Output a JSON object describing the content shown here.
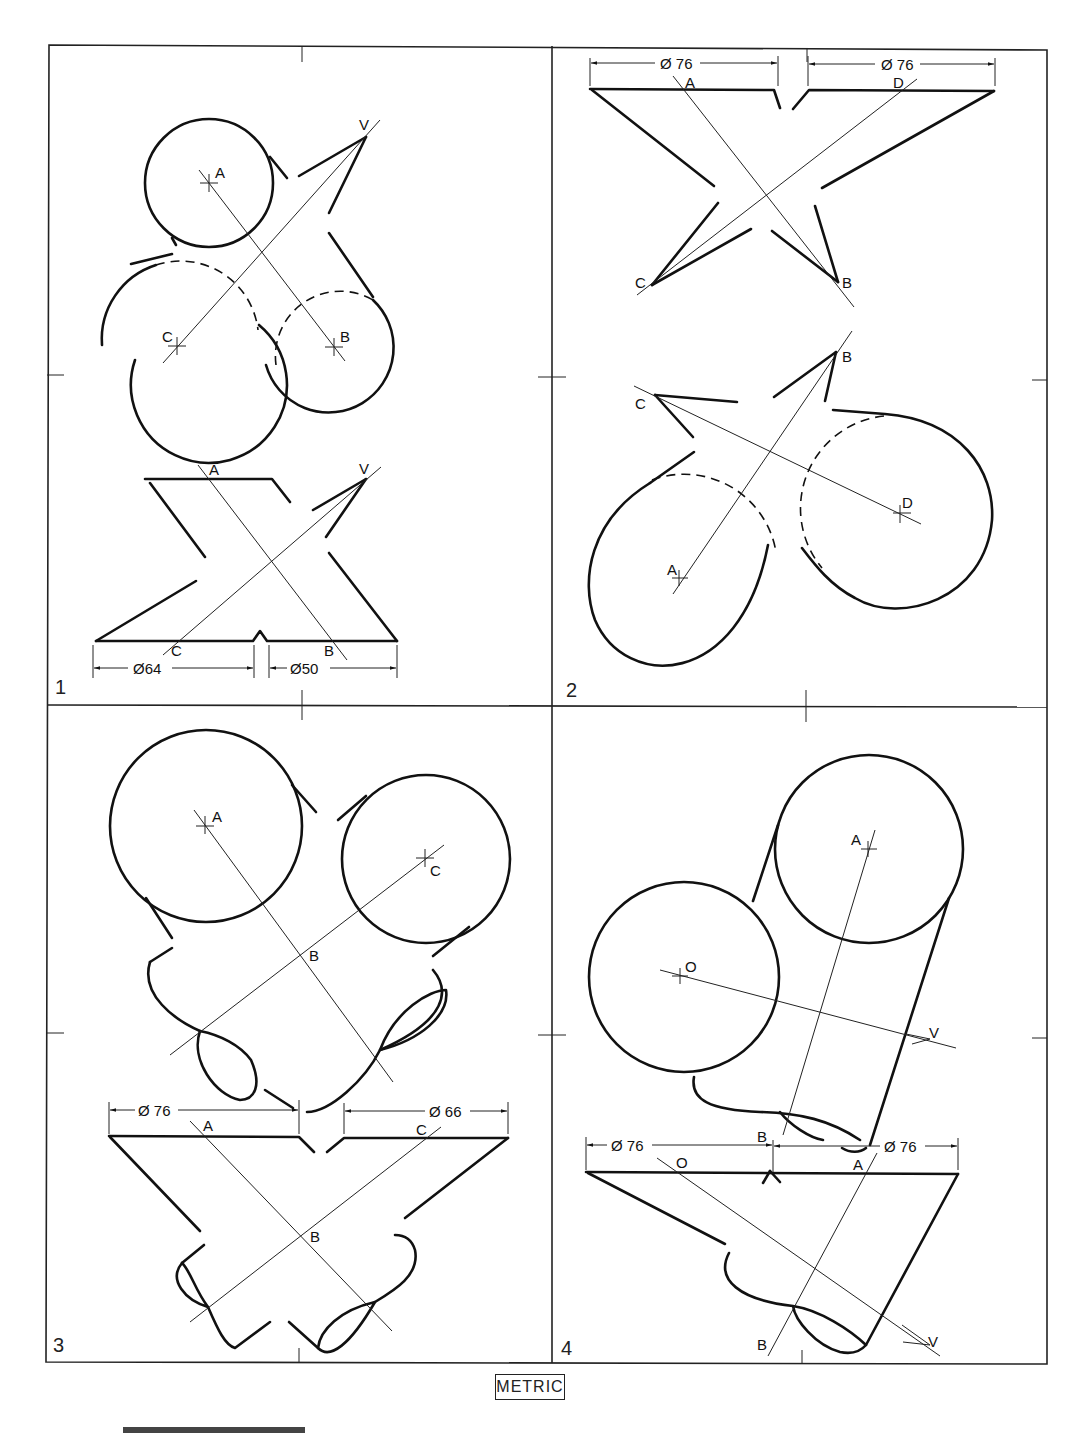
{
  "sheet": {
    "footer_label": "METRIC",
    "panels": [
      {
        "number": "1",
        "labels": {
          "top_view": [
            "A",
            "B",
            "C",
            "V"
          ],
          "front_view": [
            "A",
            "B",
            "C",
            "V"
          ]
        },
        "dimensions": [
          "Ø64",
          "Ø50"
        ]
      },
      {
        "number": "2",
        "labels": {
          "front_view": [
            "A",
            "B",
            "C",
            "D"
          ],
          "top_view": [
            "A",
            "B",
            "C",
            "D"
          ]
        },
        "dimensions": [
          "Ø 76",
          "Ø 76"
        ]
      },
      {
        "number": "3",
        "labels": {
          "top_view": [
            "A",
            "B",
            "C"
          ],
          "front_view": [
            "A",
            "B",
            "C"
          ]
        },
        "dimensions": [
          "Ø 76",
          "Ø 66"
        ]
      },
      {
        "number": "4",
        "labels": {
          "top_view": [
            "A",
            "O",
            "V"
          ],
          "front_view": [
            "A",
            "B",
            "B",
            "O",
            "V"
          ]
        },
        "dimensions": [
          "Ø 76",
          "Ø 76"
        ]
      }
    ]
  },
  "p1": {
    "num": "1",
    "a": "A",
    "b": "B",
    "c": "C",
    "v": "V",
    "a2": "A",
    "b2": "B",
    "c2": "C",
    "v2": "V",
    "d1": "Ø64",
    "d2": "Ø50"
  },
  "p2": {
    "num": "2",
    "a": "A",
    "b": "B",
    "c": "C",
    "d": "D",
    "a2": "A",
    "b2": "B",
    "c2": "C",
    "d2": "D",
    "dim1": "Ø 76",
    "dim2": "Ø 76"
  },
  "p3": {
    "num": "3",
    "a": "A",
    "b": "B",
    "c": "C",
    "a2": "A",
    "b2": "B",
    "c2": "C",
    "dim1": "Ø 76",
    "dim2": "Ø 66"
  },
  "p4": {
    "num": "4",
    "a": "A",
    "o": "O",
    "v": "V",
    "a2": "A",
    "o2": "O",
    "v2": "V",
    "b1": "B",
    "b2": "B",
    "dim1": "Ø 76",
    "dim2": "Ø 76"
  }
}
